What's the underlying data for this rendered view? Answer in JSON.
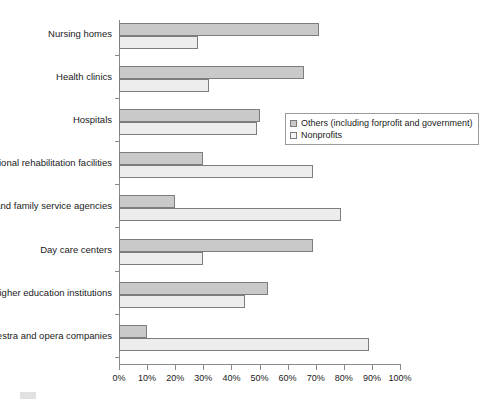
{
  "chart_data": {
    "type": "bar",
    "orientation": "horizontal",
    "title": "",
    "xlabel": "",
    "ylabel": "",
    "xlim": [
      0,
      100
    ],
    "xtick_labels": [
      "0%",
      "10%",
      "20%",
      "30%",
      "40%",
      "50%",
      "60%",
      "70%",
      "80%",
      "90%",
      "100%"
    ],
    "xtick_values": [
      0,
      10,
      20,
      30,
      40,
      50,
      60,
      70,
      80,
      90,
      100
    ],
    "grid": false,
    "legend_position": "middle-right (overlaid on plot)",
    "categories": [
      "Nursing homes",
      "Health clinics",
      "Hospitals",
      "Vocational rehabilitation facilities",
      "Individual and family service agencies",
      "Day care centers",
      "Higher education institutions",
      "Orchestra and opera companies"
    ],
    "series": [
      {
        "name": "Others (including forprofit and government)",
        "color": "#c9c9c9",
        "values": [
          71,
          66,
          50,
          30,
          20,
          69,
          53,
          10
        ]
      },
      {
        "name": "Nonprofits",
        "color": "#ededed",
        "values": [
          28,
          32,
          49,
          69,
          79,
          30,
          45,
          89
        ]
      }
    ]
  },
  "legend": {
    "entries": [
      {
        "label": "Others (including forprofit and government)",
        "swatch": "legend-swatch-others"
      },
      {
        "label": "Nonprofits",
        "swatch": "legend-swatch-nonprofits"
      }
    ]
  },
  "footer_artifact": {
    "text": ""
  }
}
